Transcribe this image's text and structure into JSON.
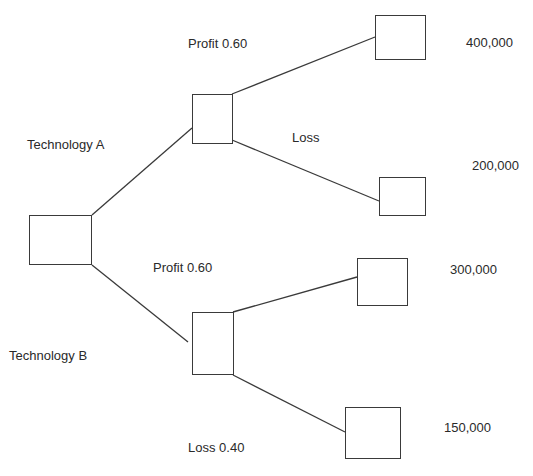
{
  "diagram": {
    "type": "decision-tree",
    "nodes": {
      "root": {
        "label": ""
      },
      "tech_a": {
        "label": ""
      },
      "tech_b": {
        "label": ""
      },
      "leaf_a_profit": {
        "label": ""
      },
      "leaf_a_loss": {
        "label": ""
      },
      "leaf_b_profit": {
        "label": ""
      },
      "leaf_b_loss": {
        "label": ""
      }
    },
    "labels": {
      "technology_a": "Technology A",
      "technology_b": "Technology B",
      "a_profit": "Profit 0.60",
      "a_loss": "Loss",
      "b_profit": "Profit 0.60",
      "b_loss": "Loss 0.40"
    },
    "payoffs": {
      "a_profit": "400,000",
      "a_loss": "200,000",
      "b_profit": "300,000",
      "b_loss": "150,000"
    },
    "edges": [
      {
        "from": "root",
        "to": "tech_a",
        "label": "Technology A"
      },
      {
        "from": "root",
        "to": "tech_b",
        "label": "Technology B"
      },
      {
        "from": "tech_a",
        "to": "leaf_a_profit",
        "label": "Profit 0.60",
        "payoff": "400,000"
      },
      {
        "from": "tech_a",
        "to": "leaf_a_loss",
        "label": "Loss",
        "payoff": "200,000"
      },
      {
        "from": "tech_b",
        "to": "leaf_b_profit",
        "label": "Profit 0.60",
        "payoff": "300,000"
      },
      {
        "from": "tech_b",
        "to": "leaf_b_loss",
        "label": "Loss 0.40",
        "payoff": "150,000"
      }
    ],
    "colors": {
      "line": "#3a3a3a",
      "text": "#2a2a2a",
      "background": "#ffffff"
    }
  }
}
